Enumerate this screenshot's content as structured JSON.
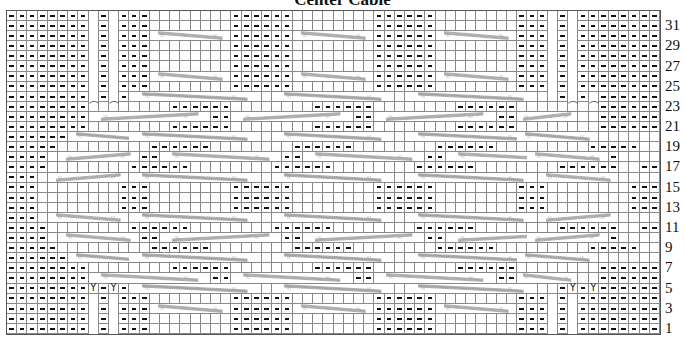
{
  "title": "Center Cable",
  "chart": {
    "columns": 64,
    "rows": 32,
    "legend_symbols": {
      "-": "purl",
      ".": "knit",
      "N": "no stitch",
      "Y": "make one increase",
      "D": "decrease"
    },
    "row_numbers": [
      "31",
      "29",
      "27",
      "25",
      "23",
      "21",
      "19",
      "17",
      "15",
      "13",
      "11",
      "9",
      "7",
      "5",
      "3",
      "1"
    ],
    "grid_rows_top_to_bottom": [
      {
        "row": 32,
        "cells": "--------N-N---........------........------........---N-N--------",
        "cables": []
      },
      {
        "row": 31,
        "cells": "--------N-N---........------........------........---N-N--------",
        "cables": []
      },
      {
        "row": 30,
        "cells": "--------N-N---........------........------........---N-N--------",
        "cables": [
          [
            14,
            21,
            "R"
          ],
          [
            28,
            35,
            "R"
          ],
          [
            42,
            49,
            "R"
          ]
        ]
      },
      {
        "row": 29,
        "cells": "--------N-N---........------........------........---N-N--------",
        "cables": []
      },
      {
        "row": 28,
        "cells": "--------N-N---........------........------........---N-N--------",
        "cables": []
      },
      {
        "row": 27,
        "cells": "--------N-N---........------........------........---N-N--------",
        "cables": []
      },
      {
        "row": 26,
        "cells": "--------N-N---........------........------........---N-N--------",
        "cables": [
          [
            14,
            21,
            "R"
          ],
          [
            28,
            35,
            "R"
          ],
          [
            42,
            49,
            "R"
          ]
        ]
      },
      {
        "row": 25,
        "cells": "--------N-N---........------........------........---N-N--------",
        "cables": []
      },
      {
        "row": 24,
        "cells": "--------N-N-..........................................-N-N--------",
        "cables": [
          [
            12,
            24,
            "X"
          ],
          [
            26,
            37,
            "X"
          ],
          [
            39,
            51,
            "X"
          ]
        ]
      },
      {
        "row": 23,
        "cells": "--------D.D.....------........------........------.....D.D--------",
        "cables": []
      },
      {
        "row": 22,
        "cells": "--------........------........------........------........--------",
        "cables": [
          [
            8,
            19,
            "L"
          ],
          [
            22,
            33,
            "L"
          ],
          [
            36,
            47,
            "L"
          ],
          [
            50,
            55,
            "L"
          ]
        ]
      },
      {
        "row": 21,
        "cells": "--------........------........------........------........--------",
        "cables": []
      },
      {
        "row": 20,
        "cells": "------..........................................................------",
        "cables": [
          [
            6,
            13,
            "X"
          ],
          [
            12,
            24,
            "X"
          ],
          [
            26,
            37,
            "X"
          ],
          [
            39,
            51,
            "X"
          ],
          [
            50,
            57,
            "X"
          ]
        ]
      },
      {
        "row": 19,
        "cells": "-----.........------........------........------.........-----",
        "cables": []
      },
      {
        "row": 18,
        "cells": "----.........------........------........------.........----",
        "cables": [
          [
            5,
            12,
            "L"
          ],
          [
            15,
            26,
            "R"
          ],
          [
            29,
            40,
            "R"
          ],
          [
            43,
            54,
            "R"
          ],
          [
            51,
            58,
            "R"
          ]
        ]
      },
      {
        "row": 17,
        "cells": "----........------........------........------........------..----",
        "cables": []
      },
      {
        "row": 16,
        "cells": "---.............................................................---",
        "cables": [
          [
            4,
            11,
            "L"
          ],
          [
            12,
            24,
            "X"
          ],
          [
            26,
            37,
            "X"
          ],
          [
            39,
            51,
            "X"
          ],
          [
            52,
            59,
            "R"
          ]
        ]
      },
      {
        "row": 15,
        "cells": "---........---........------........------........---........---",
        "cables": []
      },
      {
        "row": 14,
        "cells": "---........---........------........------........---........---",
        "cables": []
      },
      {
        "row": 13,
        "cells": "---........---........------........------........---........---",
        "cables": []
      },
      {
        "row": 12,
        "cells": "---.............................................................---",
        "cables": [
          [
            4,
            11,
            "R"
          ],
          [
            12,
            24,
            "X"
          ],
          [
            26,
            37,
            "X"
          ],
          [
            39,
            51,
            "X"
          ],
          [
            52,
            59,
            "L"
          ]
        ]
      },
      {
        "row": 11,
        "cells": "----........------........------........------........------..----",
        "cables": []
      },
      {
        "row": 10,
        "cells": "----.........------........------........------.........----",
        "cables": [
          [
            5,
            12,
            "R"
          ],
          [
            15,
            26,
            "L"
          ],
          [
            29,
            40,
            "L"
          ],
          [
            43,
            54,
            "L"
          ],
          [
            51,
            58,
            "L"
          ]
        ]
      },
      {
        "row": 9,
        "cells": "-----.........------........------........------.........-----",
        "cables": []
      },
      {
        "row": 8,
        "cells": "------..........................................................------",
        "cables": [
          [
            6,
            13,
            "X"
          ],
          [
            12,
            24,
            "X"
          ],
          [
            26,
            37,
            "X"
          ],
          [
            39,
            51,
            "X"
          ],
          [
            50,
            57,
            "X"
          ]
        ]
      },
      {
        "row": 7,
        "cells": "--------........------........------........------........--------",
        "cables": []
      },
      {
        "row": 6,
        "cells": "--------........------........------........------........--------",
        "cables": [
          [
            8,
            19,
            "R"
          ],
          [
            22,
            33,
            "R"
          ],
          [
            36,
            47,
            "R"
          ],
          [
            50,
            55,
            "R"
          ]
        ]
      },
      {
        "row": 5,
        "cells": "--------Y-Y-..........................................-Y-Y--------",
        "cables": [
          [
            12,
            24,
            "X"
          ],
          [
            26,
            37,
            "X"
          ],
          [
            39,
            51,
            "X"
          ]
        ]
      },
      {
        "row": 4,
        "cells": "--------N-N---........------........------........---N-N--------",
        "cables": []
      },
      {
        "row": 3,
        "cells": "--------N-N---........------........------........---N-N--------",
        "cables": [
          [
            14,
            21,
            "R"
          ],
          [
            28,
            35,
            "R"
          ],
          [
            42,
            49,
            "R"
          ]
        ]
      },
      {
        "row": 2,
        "cells": "--------N-N---........------........------........---N-N--------",
        "cables": []
      },
      {
        "row": 1,
        "cells": "--------N-N---........------........------........---N-N--------",
        "cables": []
      }
    ]
  }
}
